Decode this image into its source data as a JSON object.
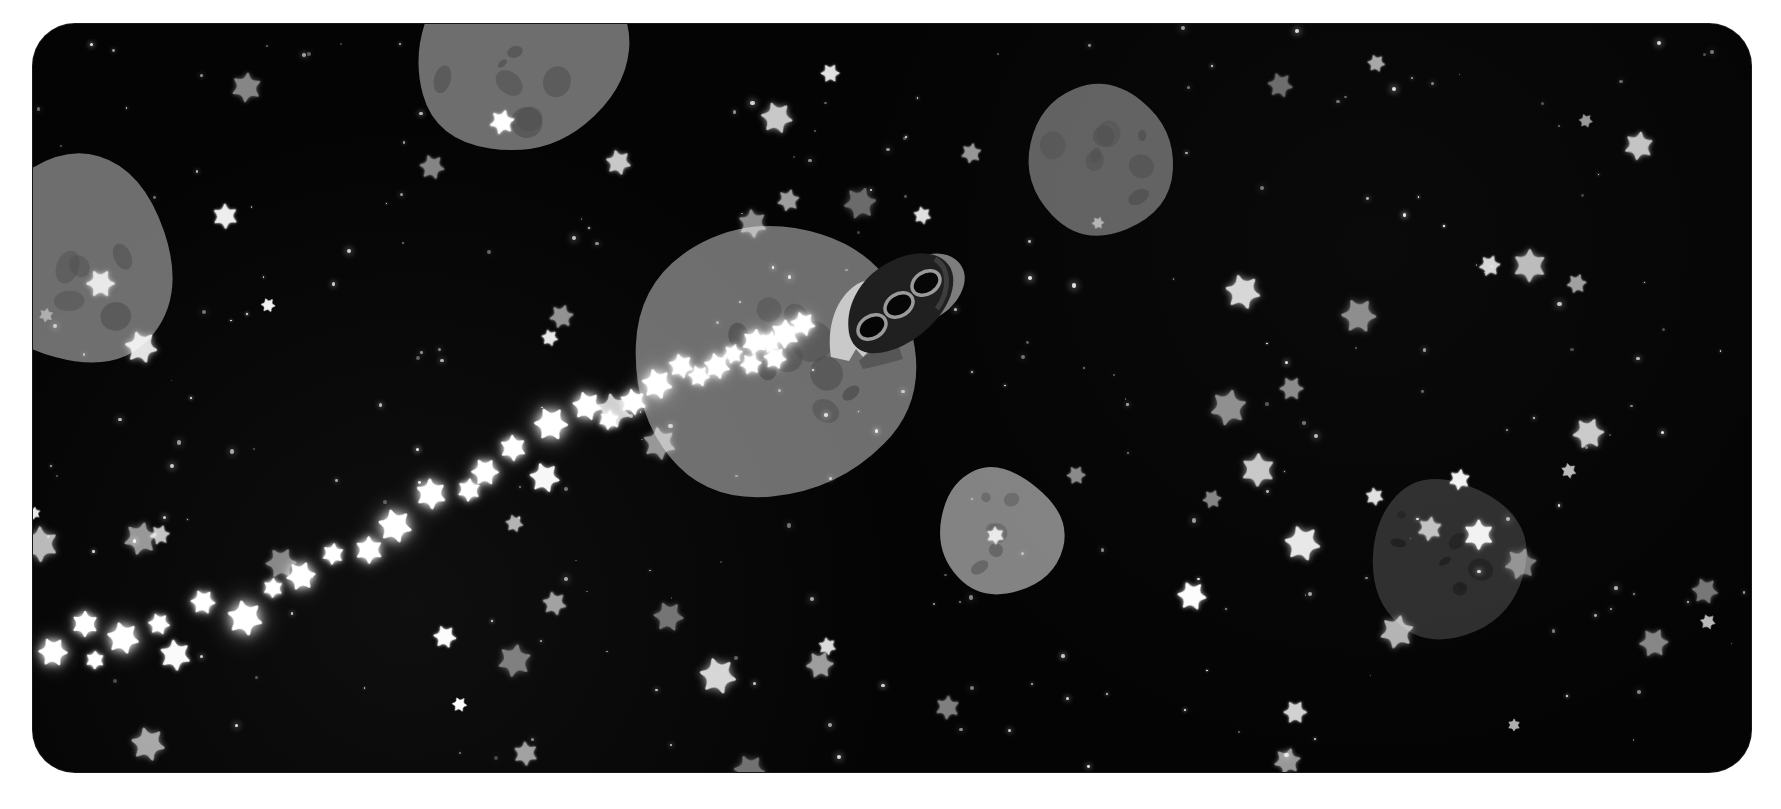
{
  "scene": {
    "title": "Rocket flying through an asteroid field",
    "background_color": "#ffffff",
    "space_color": "#040404",
    "canvas": {
      "x": 33,
      "y": 24,
      "width": 1718,
      "height": 748,
      "corner_radius": 42
    }
  },
  "palette": {
    "space_black": "#040404",
    "page_white": "#ffffff",
    "asteroid_light": "#8a8a8a",
    "asteroid_mid": "#6e6e6e",
    "asteroid_dark": "#2e2e2e",
    "crater": "#4a4a4a",
    "rocket_body": "#1e1e1e",
    "rocket_nose": "#7c7c7c",
    "rocket_fin": "#c9c9c9",
    "porthole": "#050505",
    "porthole_rim": "#9a9a9a",
    "sparkle_white": "#ffffff",
    "star_white": "#ffffff"
  },
  "rocket": {
    "name": "rocket-ship",
    "x": 790,
    "y": 215,
    "width": 150,
    "height": 130,
    "rotation_deg": -32,
    "porthole_count": 3,
    "description": "dark rounded rocket with three round portholes, light gray nose cone and a pale notched tail fin"
  },
  "asteroids": [
    {
      "name": "asteroid-top-center",
      "x": 335,
      "y": -95,
      "w": 300,
      "h": 250,
      "fill": "#6e6e6e",
      "rot": 14,
      "sides": 7,
      "craters": 8
    },
    {
      "name": "asteroid-left-edge",
      "x": -80,
      "y": 110,
      "w": 250,
      "h": 250,
      "fill": "#6e6e6e",
      "rot": -18,
      "sides": 6,
      "craters": 6
    },
    {
      "name": "asteroid-top-right",
      "x": 970,
      "y": 45,
      "w": 190,
      "h": 185,
      "fill": "#616161",
      "rot": 8,
      "sides": 6,
      "craters": 8
    },
    {
      "name": "asteroid-center-big",
      "x": 580,
      "y": 180,
      "w": 320,
      "h": 320,
      "fill": "#6e6e6e",
      "rot": -6,
      "sides": 7,
      "craters": 9
    },
    {
      "name": "asteroid-bottom-mid",
      "x": 890,
      "y": 425,
      "w": 150,
      "h": 165,
      "fill": "#838383",
      "rot": 10,
      "sides": 6,
      "craters": 6
    },
    {
      "name": "asteroid-bottom-right",
      "x": 1320,
      "y": 440,
      "w": 185,
      "h": 185,
      "fill": "#2e2e2e",
      "rot": -12,
      "sides": 7,
      "craters": 7
    }
  ],
  "sparkle_trail": {
    "name": "rocket-exhaust-sparkle-trail",
    "count": 22,
    "description": "trail of glowing white six-pointed sparkles streaming down-left from the rocket"
  },
  "starfield": {
    "name": "starfield",
    "small_star_count": 230,
    "glyph_star_count": 72,
    "description": "dense field of small white dots and rounded six-pointed stars on black"
  }
}
